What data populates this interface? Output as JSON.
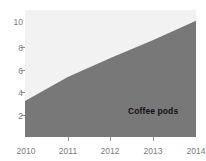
{
  "chart_data": {
    "type": "area",
    "title": "",
    "xlabel": "",
    "ylabel": "",
    "x": [
      2010,
      2011,
      2012,
      2013,
      2014
    ],
    "series": [
      {
        "name": "Coffee pods",
        "values": [
          3.0,
          5.0,
          6.6,
          8.1,
          9.7
        ],
        "color": "#787878"
      }
    ],
    "categories": [
      "2010",
      "2011",
      "2012",
      "2013",
      "2014"
    ],
    "xlim": [
      2010,
      2014
    ],
    "ylim": [
      0,
      10.6
    ],
    "grid": false,
    "legend": "none",
    "annotations": [
      {
        "text": "Coffee pods",
        "x": 2012.55,
        "y": 3.9
      }
    ],
    "plot_background": "#f2f2f2",
    "tick_label_color": "#7c7c7c"
  },
  "axes": {
    "y": {
      "ticks": [
        {
          "label": "10",
          "value": 10
        },
        {
          "label": "8",
          "value": 8
        },
        {
          "label": "6",
          "value": 6
        },
        {
          "label": "4",
          "value": 4
        },
        {
          "label": "2",
          "value": 2
        }
      ]
    },
    "x": {
      "ticks": [
        {
          "label": "2010",
          "value": 2010
        },
        {
          "label": "2011",
          "value": 2011
        },
        {
          "label": "2012",
          "value": 2012
        },
        {
          "label": "2013",
          "value": 2013
        },
        {
          "label": "2014",
          "value": 2014
        }
      ]
    }
  },
  "series_label": {
    "text": "Coffee pods"
  }
}
